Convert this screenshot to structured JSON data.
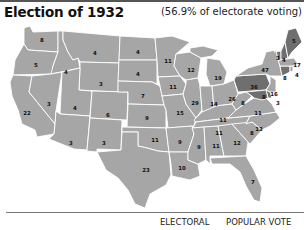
{
  "header": {
    "title": "Election of 1932",
    "subtitle": "(56.9% of electorate voting)"
  },
  "legend": {
    "electoral_label": "ELECTORAL",
    "popular_label": "POPULAR VOTE"
  },
  "colors": {
    "democratic_fill": "#a6a6a6",
    "republican_fill": "#6f6f6f",
    "state_border": "#ffffff"
  },
  "states": {
    "WA": {
      "ev": "8"
    },
    "OR": {
      "ev": "5"
    },
    "CA": {
      "ev": "22"
    },
    "ID": {
      "ev": "4"
    },
    "NV": {
      "ev": "3"
    },
    "MT": {
      "ev": "4"
    },
    "WY": {
      "ev": "3"
    },
    "UT": {
      "ev": "4"
    },
    "AZ": {
      "ev": "3"
    },
    "CO": {
      "ev": "6"
    },
    "NM": {
      "ev": "3"
    },
    "ND": {
      "ev": "4"
    },
    "SD": {
      "ev": "4"
    },
    "NE": {
      "ev": "7"
    },
    "KS": {
      "ev": "9"
    },
    "OK": {
      "ev": "11"
    },
    "TX": {
      "ev": "23"
    },
    "MN": {
      "ev": "11"
    },
    "IA": {
      "ev": "11"
    },
    "MO": {
      "ev": "15"
    },
    "AR": {
      "ev": "9"
    },
    "LA": {
      "ev": "10"
    },
    "WI": {
      "ev": "12"
    },
    "IL": {
      "ev": "29"
    },
    "MI": {
      "ev": "19"
    },
    "IN": {
      "ev": "14"
    },
    "OH": {
      "ev": "26"
    },
    "KY": {
      "ev": "11"
    },
    "TN": {
      "ev": "11"
    },
    "MS": {
      "ev": "9"
    },
    "AL": {
      "ev": "11"
    },
    "GA": {
      "ev": "12"
    },
    "FL": {
      "ev": "7"
    },
    "SC": {
      "ev": "8"
    },
    "NC": {
      "ev": "13"
    },
    "VA": {
      "ev": "11"
    },
    "WV": {
      "ev": "8"
    },
    "PA": {
      "ev": "36"
    },
    "NY": {
      "ev": "47"
    },
    "NJ": {
      "ev": "16"
    },
    "DE": {
      "ev": "3"
    },
    "MD": {
      "ev": "8"
    },
    "CT": {
      "ev": "8"
    },
    "RI": {
      "ev": "4"
    },
    "MA": {
      "ev": "17"
    },
    "VT": {
      "ev": "3"
    },
    "NH": {
      "ev": "4"
    },
    "ME": {
      "ev": "5"
    }
  }
}
